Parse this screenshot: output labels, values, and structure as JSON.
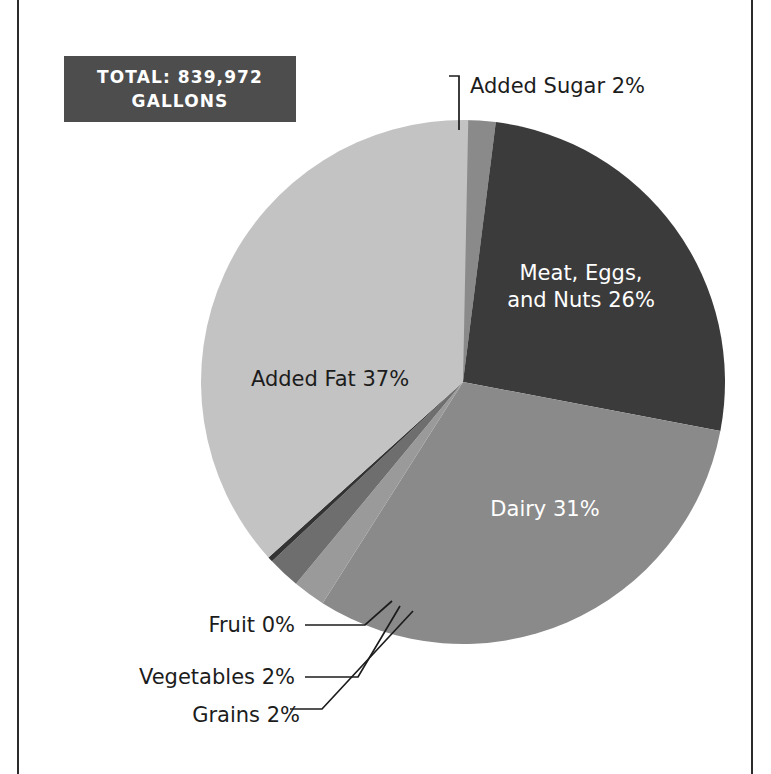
{
  "figure": {
    "background_color": "#ffffff",
    "frame_color": "#2b2b2b"
  },
  "badge": {
    "name": "total-badge",
    "line1": "TOTAL: 839,972",
    "line2": "GALLONS",
    "background_color": "#4d4d4d",
    "text_color": "#ffffff"
  },
  "chart_data": {
    "type": "pie",
    "title": "",
    "subtitle": "",
    "xlabel": "",
    "ylabel": "",
    "total_label": "TOTAL: 839,972 GALLONS",
    "total_value": 839972,
    "units": "gallons",
    "legend": "none",
    "grid": false,
    "start_angle_deg": -90,
    "direction": "clockwise",
    "categories": [
      "Added Sugar",
      "Meat, Eggs, and Nuts",
      "Dairy",
      "Grains",
      "Vegetables",
      "Fruit",
      "Added Fat"
    ],
    "values": [
      2,
      26,
      31,
      2,
      2,
      0,
      37
    ],
    "value_unit": "percent",
    "slices": [
      {
        "label": "Added Sugar 2%",
        "name": "Added Sugar",
        "value": 2,
        "color": "#8a8a8a",
        "label_placement": "outside",
        "label_text_color": "#1c1c1c"
      },
      {
        "label": "Meat, Eggs, and Nuts 26%",
        "name": "Meat, Eggs, and Nuts",
        "value": 26,
        "color": "#3b3b3b",
        "label_placement": "inside",
        "label_text_color": "#ffffff",
        "label_line1": "Meat, Eggs,",
        "label_line2": "and Nuts 26%"
      },
      {
        "label": "Dairy 31%",
        "name": "Dairy",
        "value": 31,
        "color": "#8a8a8a",
        "label_placement": "inside",
        "label_text_color": "#ffffff"
      },
      {
        "label": "Grains 2%",
        "name": "Grains",
        "value": 2,
        "color": "#9a9a9a",
        "label_placement": "outside",
        "label_text_color": "#1c1c1c"
      },
      {
        "label": "Vegetables 2%",
        "name": "Vegetables",
        "value": 2,
        "color": "#6e6e6e",
        "label_placement": "outside",
        "label_text_color": "#1c1c1c"
      },
      {
        "label": "Fruit 0%",
        "name": "Fruit",
        "value": 0,
        "color": "#333333",
        "label_placement": "outside",
        "label_text_color": "#1c1c1c"
      },
      {
        "label": "Added Fat 37%",
        "name": "Added Fat",
        "value": 37,
        "color": "#c3c3c3",
        "label_placement": "inside",
        "label_text_color": "#1c1c1c"
      }
    ]
  }
}
